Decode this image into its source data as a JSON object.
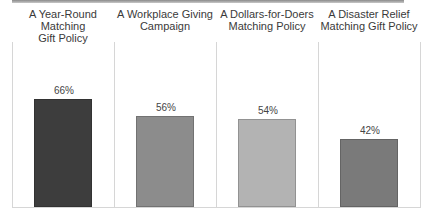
{
  "chart_data": {
    "type": "bar",
    "title": "",
    "xlabel": "",
    "ylabel": "",
    "ylim": [
      0,
      100
    ],
    "grid": false,
    "legend": null,
    "categories": [
      "A Year-Round Matching Gift Policy",
      "A Workplace Giving Campaign",
      "A Dollars-for-Doers Matching Policy",
      "A Disaster Relief Matching Gift Policy"
    ],
    "values": [
      66,
      56,
      54,
      42
    ],
    "value_labels": [
      "66%",
      "56%",
      "54%",
      "42%"
    ],
    "colors": [
      "#3d3d3d",
      "#8c8c8c",
      "#b3b3b3",
      "#7a7a7a"
    ]
  },
  "panels": [
    {
      "title_line1": "A Year-Round Matching",
      "title_line2": "Gift Policy",
      "label": "66%",
      "value": 66,
      "color": "#3d3d3d"
    },
    {
      "title_line1": "A Workplace Giving",
      "title_line2": "Campaign",
      "label": "56%",
      "value": 56,
      "color": "#8c8c8c"
    },
    {
      "title_line1": "A Dollars-for-Doers",
      "title_line2": "Matching Policy",
      "label": "54%",
      "value": 54,
      "color": "#b3b3b3"
    },
    {
      "title_line1": "A Disaster Relief",
      "title_line2": "Matching Gift Policy",
      "label": "42%",
      "value": 42,
      "color": "#7a7a7a"
    }
  ]
}
